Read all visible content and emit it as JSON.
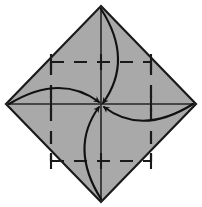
{
  "figure": {
    "title": "Origami fold step: bring four corners to center",
    "type": "origami-instruction-diagram",
    "canvas": {
      "width": 202,
      "height": 207,
      "background": "#ffffff"
    }
  },
  "colors": {
    "paper_fill": "#a9a9a9",
    "outline": "#1a1a1a",
    "crease_line": "#262626",
    "dashed_line": "#1a1a1a",
    "arrow": "#111111"
  },
  "shape": {
    "name": "square-rotated-45",
    "label": "diamond-paper",
    "vertices": [
      {
        "name": "top",
        "x": 101,
        "y": 6
      },
      {
        "name": "right",
        "x": 196,
        "y": 104
      },
      {
        "name": "bottom",
        "x": 101,
        "y": 202
      },
      {
        "name": "left",
        "x": 6,
        "y": 104
      }
    ],
    "outline_width": 2.2
  },
  "creases": [
    {
      "name": "horizontal-crease",
      "x1": 6,
      "y1": 104,
      "x2": 196,
      "y2": 104,
      "style": "solid",
      "width": 1.6
    },
    {
      "name": "vertical-crease",
      "x1": 101,
      "y1": 6,
      "x2": 101,
      "y2": 202,
      "style": "solid",
      "width": 1.6
    }
  ],
  "dashed_square": {
    "name": "inner-dashed-square",
    "left": 51,
    "top": 62,
    "right": 151,
    "bottom": 161,
    "dash_pattern": "13 10",
    "width": 2.2,
    "ticks": [
      {
        "name": "tick-top-left",
        "x": 51,
        "y": 62,
        "orientation": "vertical"
      },
      {
        "name": "tick-top-center",
        "x": 101,
        "y": 62,
        "orientation": "vertical"
      },
      {
        "name": "tick-top-right",
        "x": 151,
        "y": 62,
        "orientation": "vertical"
      },
      {
        "name": "tick-middle-left",
        "x": 51,
        "y": 104,
        "orientation": "vertical"
      },
      {
        "name": "tick-middle-right",
        "x": 151,
        "y": 104,
        "orientation": "vertical"
      },
      {
        "name": "tick-bottom-left",
        "x": 51,
        "y": 161,
        "orientation": "vertical"
      },
      {
        "name": "tick-bottom-center",
        "x": 101,
        "y": 161,
        "orientation": "vertical"
      },
      {
        "name": "tick-bottom-right",
        "x": 151,
        "y": 161,
        "orientation": "vertical"
      }
    ]
  },
  "arrows": [
    {
      "name": "arrow-top-to-center",
      "from": "top-vertex",
      "to": "center",
      "start": {
        "x": 101,
        "y": 9
      },
      "control": {
        "x": 134,
        "y": 60
      },
      "end": {
        "x": 103,
        "y": 103
      },
      "direction": "down",
      "bulge": "right"
    },
    {
      "name": "arrow-right-to-center",
      "from": "right-vertex",
      "to": "center",
      "start": {
        "x": 193,
        "y": 104
      },
      "control": {
        "x": 142,
        "y": 136
      },
      "end": {
        "x": 104,
        "y": 107
      },
      "direction": "left",
      "bulge": "down"
    },
    {
      "name": "arrow-bottom-to-center",
      "from": "bottom-vertex",
      "to": "center",
      "start": {
        "x": 101,
        "y": 199
      },
      "control": {
        "x": 69,
        "y": 148
      },
      "end": {
        "x": 99,
        "y": 107
      },
      "direction": "up",
      "bulge": "left"
    },
    {
      "name": "arrow-left-to-center",
      "from": "left-vertex",
      "to": "center",
      "start": {
        "x": 9,
        "y": 104
      },
      "control": {
        "x": 60,
        "y": 73
      },
      "end": {
        "x": 99,
        "y": 102
      },
      "direction": "right",
      "bulge": "up"
    }
  ],
  "center_point": {
    "name": "center-convergence-point",
    "x": 101,
    "y": 104
  }
}
